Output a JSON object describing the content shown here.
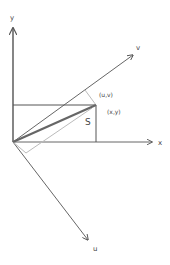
{
  "diagram": {
    "type": "coordinate-rotation",
    "axes": {
      "x_label": "x",
      "y_label": "y",
      "u_label": "u",
      "v_label": "v"
    },
    "point_labels": {
      "xy": "(x,y)",
      "uv": "(u,v)"
    },
    "area_label": "S",
    "colors": {
      "axis": "#555555",
      "vector": "#666666",
      "projection": "#bbbbbb",
      "background": "#ffffff"
    }
  }
}
